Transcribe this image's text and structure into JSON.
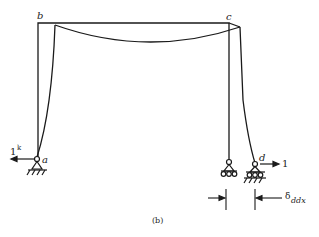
{
  "figure": {
    "caption": "(b)",
    "nodes": {
      "b": "b",
      "c": "c",
      "a": "a",
      "d": "d"
    },
    "loads": {
      "left_load": "1",
      "left_load_unit": "k",
      "right_load": "1"
    },
    "dimension": {
      "symbol": "δ",
      "subscript": "ddx"
    },
    "colors": {
      "line": "#1a1a1a",
      "background": "#ffffff"
    }
  }
}
